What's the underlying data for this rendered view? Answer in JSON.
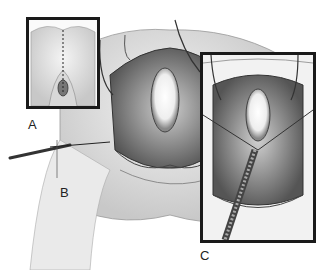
{
  "figure": {
    "panels": [
      {
        "id": "A",
        "label": "A",
        "content": "Inset view of perineum with dashed midline incision line"
      },
      {
        "id": "B",
        "label": "B",
        "content": "Main view of opened surgical field with suture needle being passed"
      },
      {
        "id": "C",
        "label": "C",
        "content": "Inset close-up of surgical field with retractor sutures and forceps"
      }
    ]
  }
}
